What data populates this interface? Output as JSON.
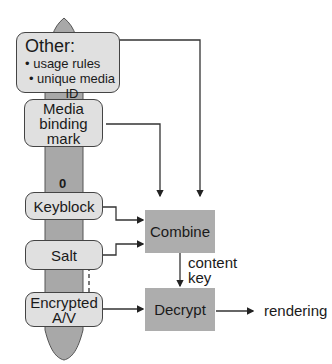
{
  "diagram": {
    "nodes": {
      "other": {
        "title": "Other:",
        "bullets": [
          "• usage rules",
          "• unique media ID",
          "• ..."
        ]
      },
      "media_binding_mark": {
        "lines": [
          "Media",
          "binding",
          "mark"
        ]
      },
      "zero_marker": "0",
      "keyblock": "Keyblock",
      "salt": "Salt",
      "encrypted_av": {
        "lines": [
          "Encrypted",
          "A/V"
        ]
      },
      "combine": "Combine",
      "decrypt": "Decrypt"
    },
    "edge_labels": {
      "content_key": [
        "content",
        "key"
      ],
      "rendering": "rendering"
    },
    "colors": {
      "node_fill": "#e0e0e0",
      "process_fill": "#adadad",
      "column_fill": "#a8a8a8",
      "stroke": "#333333"
    }
  }
}
